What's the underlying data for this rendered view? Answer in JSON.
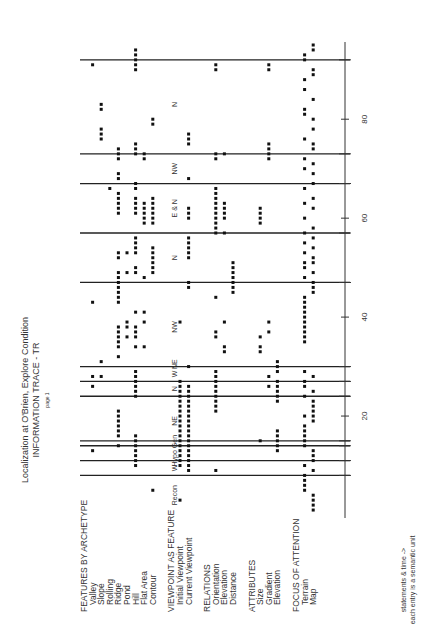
{
  "chart_data": {
    "type": "scatter",
    "title": "Localization at O'Brien, Explore Condition",
    "subtitle": "INFORMATION TRACE - TR",
    "page_label": "page 1",
    "orientation": "rotated-90-ccw",
    "xlabel": "statements & time ->",
    "xlabel_note": "each entry is a semantic unit",
    "xlim": [
      0,
      95
    ],
    "xticks": [
      20,
      40,
      60,
      80
    ],
    "groups": [
      {
        "name": "FEATURES BY ARCHETYPE",
        "rows": [
          "Valley",
          "Slope",
          "Rolling",
          "Ridge",
          "Pond",
          "Hill",
          "Flat Area",
          "Contour"
        ]
      },
      {
        "name": "VIEWPOINT AS FEATURE",
        "rows": [
          "Initial Viewpoint",
          "Current Viewpoint"
        ]
      },
      {
        "name": "RELATIONS",
        "rows": [
          "Orientation",
          "Elevation",
          "Distance"
        ]
      },
      {
        "name": "ATTRIBUTES",
        "rows": [
          "Size",
          "Gradient",
          "Elevation"
        ]
      },
      {
        "name": "FOCUS OF ATTENTION",
        "rows": [
          "Terrain",
          "Map"
        ]
      }
    ],
    "episode_boundaries": [
      8,
      11,
      14,
      15,
      24,
      27,
      30,
      47,
      57,
      67,
      73,
      92
    ],
    "episode_labels": [
      {
        "label": "Recon",
        "x": 4
      },
      {
        "label": "W",
        "x": 9.5
      },
      {
        "label": "Hypo Gen",
        "x": 13
      },
      {
        "label": "NE",
        "x": 19
      },
      {
        "label": "N",
        "x": 25.5
      },
      {
        "label": "W",
        "x": 28.5
      },
      {
        "label": "NE",
        "x": 30.5
      },
      {
        "label": "NW",
        "x": 38
      },
      {
        "label": "N",
        "x": 52
      },
      {
        "label": "E & N",
        "x": 62
      },
      {
        "label": "NW",
        "x": 70
      },
      {
        "label": "N",
        "x": 83
      }
    ],
    "points": [
      {
        "row": "Valley",
        "x": [
          13,
          26,
          28,
          43,
          91
        ]
      },
      {
        "row": "Slope",
        "x": [
          28,
          31,
          76,
          77,
          78,
          82,
          83
        ]
      },
      {
        "row": "Rolling",
        "x": [
          66
        ]
      },
      {
        "row": "Ridge",
        "x": [
          14,
          16,
          17,
          18,
          19,
          20,
          21,
          32,
          34,
          35,
          36,
          37,
          38,
          43,
          44,
          45,
          46,
          47,
          48,
          49,
          52,
          53,
          61,
          62,
          63,
          64,
          65,
          68,
          69,
          72,
          73,
          74
        ]
      },
      {
        "row": "Pond",
        "x": [
          36,
          38,
          39,
          49,
          53
        ]
      },
      {
        "row": "Hill",
        "x": [
          10,
          11,
          12,
          13,
          14,
          15,
          16,
          24,
          25,
          26,
          27,
          28,
          29,
          34,
          36,
          37,
          38,
          41,
          49,
          50,
          53,
          54,
          55,
          56,
          61,
          62,
          63,
          64,
          66,
          67,
          73,
          74,
          75,
          90,
          91,
          92,
          93,
          94
        ]
      },
      {
        "row": "Flat Area",
        "x": [
          34,
          39,
          41,
          48,
          59,
          60,
          61,
          62,
          63,
          72,
          73
        ]
      },
      {
        "row": "Contour",
        "x": [
          5,
          49,
          50,
          51,
          52,
          53,
          54,
          59,
          60,
          61,
          62,
          63,
          64,
          79,
          80
        ]
      },
      {
        "row": "Initial Viewpoint",
        "x": [
          3,
          10,
          11,
          12,
          13,
          14,
          15,
          16,
          17,
          18,
          19,
          20,
          21,
          22,
          23,
          24,
          25,
          26,
          27,
          39
        ]
      },
      {
        "row": "Current Viewpoint",
        "x": [
          9,
          10,
          11,
          12,
          13,
          14,
          15,
          16,
          17,
          18,
          19,
          20,
          21,
          22,
          23,
          24,
          25,
          26,
          30,
          46,
          47,
          52,
          53,
          54,
          55,
          56,
          60,
          61,
          62,
          68,
          75,
          76,
          77
        ]
      },
      {
        "row": "Orientation",
        "x": [
          9,
          21,
          22,
          23,
          24,
          25,
          26,
          27,
          28,
          29,
          36,
          37,
          44,
          57,
          58,
          59,
          60,
          61,
          62,
          63,
          64,
          65,
          66,
          72,
          73,
          90,
          91
        ]
      },
      {
        "row": "Elevation",
        "x": [
          33,
          34,
          39,
          57,
          60,
          61,
          62,
          63,
          73
        ]
      },
      {
        "row": "Distance",
        "x": [
          45,
          46,
          47,
          48,
          49,
          50,
          51
        ]
      },
      {
        "row": "Size",
        "x": [
          15,
          33,
          34,
          36,
          59,
          60,
          61,
          62
        ]
      },
      {
        "row": "Gradient",
        "x": [
          26,
          28,
          37,
          39,
          72,
          73,
          74,
          75,
          90,
          91
        ]
      },
      {
        "row": "Elevation",
        "x": [
          13,
          14,
          15,
          16,
          17,
          23,
          24,
          25,
          26,
          27,
          29,
          30,
          31
        ]
      },
      {
        "row": "Terrain",
        "x": [
          5,
          6,
          7,
          8,
          10,
          14,
          15,
          16,
          17,
          18,
          20,
          24,
          26,
          27,
          29,
          35,
          36,
          37,
          38,
          39,
          40,
          41,
          42,
          43,
          44,
          48,
          50,
          51,
          53,
          55,
          57,
          60,
          63,
          66,
          70,
          72,
          76,
          81,
          82,
          86,
          88,
          92,
          93
        ]
      },
      {
        "row": "Map",
        "x": [
          1,
          2,
          3,
          4,
          9,
          11,
          12,
          13,
          19,
          20,
          21,
          22,
          23,
          25,
          28,
          45,
          46,
          47,
          49,
          51,
          52,
          54,
          56,
          58,
          62,
          64,
          67,
          69,
          71,
          74,
          75,
          78,
          80,
          84,
          89,
          90,
          94,
          95
        ]
      }
    ]
  }
}
